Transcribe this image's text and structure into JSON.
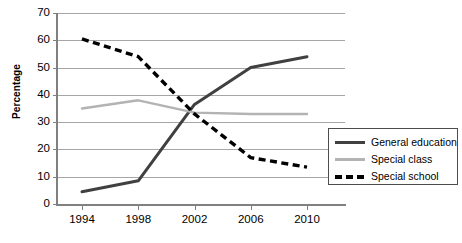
{
  "chart_data": {
    "type": "line",
    "title": "",
    "xlabel": "",
    "ylabel": "Percentage",
    "x": [
      1994,
      1998,
      2002,
      2006,
      2010
    ],
    "categories": [
      "1994",
      "1998",
      "2002",
      "2006",
      "2010"
    ],
    "ylim": [
      0,
      70
    ],
    "yticks": [
      0,
      10,
      20,
      30,
      40,
      50,
      60,
      70
    ],
    "grid": true,
    "legend_position": "right-inside",
    "series": [
      {
        "name": "General education",
        "values": [
          4.5,
          8.5,
          36.5,
          50,
          54
        ],
        "color": "#404040",
        "style": "solid"
      },
      {
        "name": "Special class",
        "values": [
          35,
          38,
          33.5,
          33,
          33
        ],
        "color": "#b3b3b3",
        "style": "solid"
      },
      {
        "name": "Special school",
        "values": [
          60.5,
          54,
          33,
          17,
          13.5
        ],
        "color": "#000000",
        "style": "dashed"
      }
    ]
  },
  "axes": {
    "y_tick_labels": [
      "70",
      "60",
      "50",
      "40",
      "30",
      "20",
      "10",
      "0"
    ],
    "x_tick_labels": [
      "1994",
      "1998",
      "2002",
      "2006",
      "2010"
    ],
    "y_axis_title": "Percentage"
  },
  "legend": {
    "items": [
      {
        "label": "General education"
      },
      {
        "label": "Special class"
      },
      {
        "label": "Special school"
      }
    ]
  }
}
